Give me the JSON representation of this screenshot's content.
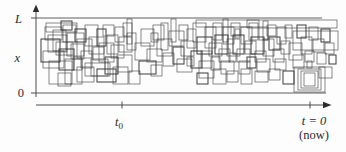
{
  "figure": {
    "background": "#fdfdfd",
    "rect_stroke": "#3c3c3c",
    "axis_stroke": "#4d4d4d",
    "labels": {
      "y_top": "L",
      "y_mid": "x",
      "y_bottom": "0",
      "t0_base": "t",
      "t0_sub": "0",
      "now": "t = 0",
      "now_paren": "(now)"
    }
  },
  "chart_data": {
    "type": "rectangle-field",
    "title": "",
    "x_axis": {
      "label": "time",
      "tick_labels": [
        "t0",
        "t = 0 (now)"
      ],
      "arrow": "right"
    },
    "y_axis": {
      "label": "x",
      "tick_labels": [
        "0",
        "L"
      ],
      "arrow": "up"
    },
    "band": {
      "x0": 38,
      "x1": 338,
      "y_top": 18,
      "y_bottom": 93
    },
    "axis_layout": {
      "y_axis_x": 36,
      "y_axis_top": 6,
      "y_axis_bottom": 97,
      "t_axis_y": 105,
      "t_axis_x0": 36,
      "t_axis_x1": 330,
      "t0_tick_x": 122,
      "now_tick_x": 310,
      "top_line_end": 322,
      "bottom_line_end": 326
    },
    "rectangles": [
      [
        41,
        39,
        19,
        23
      ],
      [
        45,
        27,
        17,
        13
      ],
      [
        48,
        35,
        19,
        17
      ],
      [
        53,
        30,
        13,
        21
      ],
      [
        56,
        42,
        17,
        13
      ],
      [
        43,
        51,
        21,
        17
      ],
      [
        59,
        49,
        15,
        21
      ],
      [
        63,
        25,
        13,
        17
      ],
      [
        67,
        33,
        17,
        23
      ],
      [
        71,
        44,
        13,
        15
      ],
      [
        49,
        61,
        23,
        23
      ],
      [
        65,
        59,
        17,
        25
      ],
      [
        75,
        29,
        11,
        13
      ],
      [
        77,
        39,
        15,
        19
      ],
      [
        81,
        51,
        11,
        17
      ],
      [
        85,
        25,
        13,
        21
      ],
      [
        89,
        37,
        15,
        17
      ],
      [
        93,
        47,
        11,
        13
      ],
      [
        97,
        29,
        9,
        17
      ],
      [
        99,
        43,
        15,
        19
      ],
      [
        91,
        59,
        17,
        17
      ],
      [
        103,
        25,
        11,
        11
      ],
      [
        107,
        35,
        11,
        19
      ],
      [
        111,
        45,
        13,
        13
      ],
      [
        105,
        57,
        13,
        17
      ],
      [
        115,
        27,
        9,
        15
      ],
      [
        119,
        37,
        13,
        15
      ],
      [
        117,
        55,
        15,
        17
      ],
      [
        123,
        23,
        9,
        13
      ],
      [
        127,
        33,
        9,
        17
      ],
      [
        61,
        21,
        11,
        9
      ],
      [
        73,
        57,
        9,
        13
      ],
      [
        46,
        23,
        31,
        9
      ],
      [
        85,
        63,
        25,
        13
      ],
      [
        58,
        73,
        13,
        13
      ],
      [
        77,
        67,
        17,
        15
      ],
      [
        97,
        69,
        19,
        13
      ],
      [
        113,
        67,
        15,
        17
      ],
      [
        129,
        71,
        11,
        13
      ],
      [
        135,
        43,
        15,
        17
      ],
      [
        141,
        29,
        13,
        17
      ],
      [
        147,
        49,
        15,
        13
      ],
      [
        139,
        61,
        17,
        13
      ],
      [
        153,
        25,
        11,
        15
      ],
      [
        157,
        39,
        15,
        17
      ],
      [
        163,
        53,
        11,
        13
      ],
      [
        161,
        23,
        7,
        27
      ],
      [
        169,
        31,
        15,
        15
      ],
      [
        173,
        47,
        11,
        17
      ],
      [
        179,
        25,
        9,
        15
      ],
      [
        181,
        41,
        13,
        15
      ],
      [
        177,
        59,
        15,
        13
      ],
      [
        187,
        29,
        9,
        19
      ],
      [
        151,
        65,
        11,
        11
      ],
      [
        191,
        51,
        11,
        17
      ],
      [
        151,
        33,
        7,
        9
      ],
      [
        187,
        57,
        7,
        9
      ],
      [
        127,
        19,
        5,
        25
      ],
      [
        171,
        19,
        5,
        23
      ],
      [
        193,
        23,
        13,
        19
      ],
      [
        197,
        37,
        15,
        17
      ],
      [
        201,
        51,
        11,
        17
      ],
      [
        205,
        27,
        11,
        21
      ],
      [
        209,
        43,
        13,
        13
      ],
      [
        199,
        61,
        15,
        17
      ],
      [
        213,
        23,
        9,
        17
      ],
      [
        215,
        35,
        13,
        19
      ],
      [
        219,
        49,
        11,
        13
      ],
      [
        223,
        27,
        11,
        17
      ],
      [
        227,
        39,
        13,
        17
      ],
      [
        221,
        61,
        13,
        13
      ],
      [
        231,
        23,
        9,
        13
      ],
      [
        233,
        35,
        11,
        19
      ],
      [
        237,
        49,
        13,
        13
      ],
      [
        241,
        27,
        11,
        17
      ],
      [
        245,
        41,
        11,
        13
      ],
      [
        239,
        61,
        11,
        13
      ],
      [
        249,
        23,
        9,
        17
      ],
      [
        251,
        37,
        13,
        17
      ],
      [
        255,
        51,
        11,
        11
      ],
      [
        259,
        27,
        9,
        13
      ],
      [
        263,
        39,
        11,
        17
      ],
      [
        257,
        59,
        13,
        13
      ],
      [
        267,
        25,
        9,
        11
      ],
      [
        269,
        37,
        11,
        13
      ],
      [
        273,
        49,
        11,
        13
      ],
      [
        277,
        27,
        9,
        17
      ],
      [
        281,
        41,
        9,
        13
      ],
      [
        275,
        59,
        11,
        11
      ],
      [
        211,
        57,
        9,
        13
      ],
      [
        247,
        57,
        9,
        11
      ],
      [
        285,
        25,
        7,
        13
      ],
      [
        229,
        53,
        7,
        9
      ],
      [
        235,
        29,
        5,
        9
      ],
      [
        223,
        19,
        5,
        23
      ],
      [
        263,
        21,
        5,
        19
      ],
      [
        197,
        73,
        11,
        11
      ],
      [
        213,
        69,
        13,
        15
      ],
      [
        227,
        71,
        11,
        11
      ],
      [
        241,
        69,
        11,
        15
      ],
      [
        255,
        71,
        13,
        11
      ],
      [
        269,
        69,
        11,
        11
      ],
      [
        283,
        71,
        11,
        13
      ],
      [
        196,
        20,
        63,
        7
      ],
      [
        247,
        20,
        90,
        8
      ],
      [
        293,
        31,
        45,
        19
      ],
      [
        289,
        43,
        13,
        17
      ],
      [
        293,
        55,
        11,
        13
      ],
      [
        297,
        25,
        9,
        13
      ],
      [
        301,
        37,
        11,
        17
      ],
      [
        305,
        51,
        9,
        11
      ],
      [
        309,
        27,
        9,
        13
      ],
      [
        313,
        39,
        11,
        13
      ],
      [
        317,
        53,
        9,
        11
      ],
      [
        321,
        29,
        9,
        13
      ],
      [
        325,
        43,
        9,
        11
      ],
      [
        294,
        67,
        31,
        25
      ],
      [
        298,
        69,
        23,
        21
      ],
      [
        301,
        71,
        17,
        17
      ],
      [
        304,
        73,
        11,
        13
      ],
      [
        329,
        55,
        7,
        9
      ],
      [
        319,
        67,
        13,
        11
      ],
      [
        307,
        61,
        5,
        7
      ]
    ]
  }
}
